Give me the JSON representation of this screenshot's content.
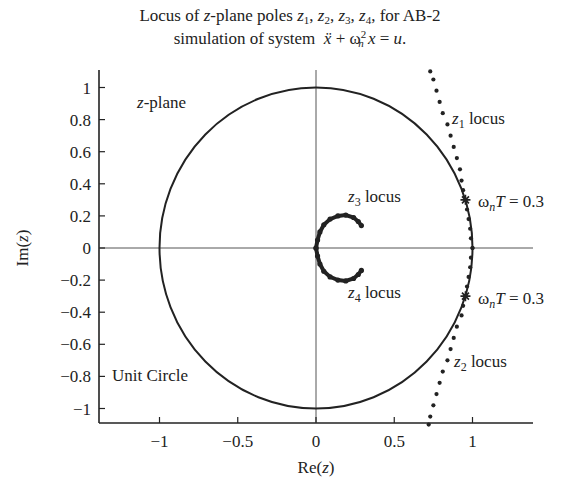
{
  "chart_data": {
    "type": "scatter",
    "title_line1": "Locus of z-plane poles z1, z2, z3, z4, for AB-2",
    "title_line2": "simulation of system ẍ + ωn² x = u.",
    "xlabel": "Re(z)",
    "ylabel": "Im(z)",
    "xlim": [
      -1.4,
      1.4
    ],
    "ylim": [
      -1.1,
      1.1
    ],
    "xticks": [
      "−1",
      "−0.5",
      "0",
      "0.5",
      "1"
    ],
    "yticks": [
      "1",
      "0.8",
      "0.6",
      "0.4",
      "0.2",
      "0",
      "−0.2",
      "−0.4",
      "−0.6",
      "−0.8",
      "−1"
    ],
    "grid": false,
    "legend": null,
    "annotations": {
      "zplane": "z-plane",
      "unit_circle": "Unit Circle",
      "z1": "z1 locus",
      "z2": "z2 locus",
      "z3": "z3 locus",
      "z4": "z4 locus",
      "wnT_upper": "ωnT = 0.3",
      "wnT_lower": "ωnT = 0.3"
    },
    "series": [
      {
        "name": "Unit circle",
        "kind": "line",
        "center": [
          0,
          0
        ],
        "radius": 1
      },
      {
        "name": "z1 locus",
        "kind": "dots",
        "points": [
          [
            0.73,
            1.1
          ],
          [
            0.75,
            1.05
          ],
          [
            0.77,
            0.98
          ],
          [
            0.79,
            0.91
          ],
          [
            0.81,
            0.84
          ],
          [
            0.84,
            0.77
          ],
          [
            0.86,
            0.7
          ],
          [
            0.88,
            0.63
          ],
          [
            0.9,
            0.56
          ],
          [
            0.92,
            0.49
          ],
          [
            0.93,
            0.42
          ],
          [
            0.94,
            0.36
          ],
          [
            0.955,
            0.3
          ],
          [
            0.965,
            0.24
          ],
          [
            0.975,
            0.18
          ],
          [
            0.985,
            0.12
          ],
          [
            0.99,
            0.06
          ],
          [
            1.0,
            0.0
          ]
        ]
      },
      {
        "name": "z2 locus",
        "kind": "dots",
        "points": [
          [
            1.0,
            0.0
          ],
          [
            0.99,
            -0.06
          ],
          [
            0.985,
            -0.12
          ],
          [
            0.975,
            -0.18
          ],
          [
            0.965,
            -0.24
          ],
          [
            0.955,
            -0.3
          ],
          [
            0.94,
            -0.36
          ],
          [
            0.93,
            -0.42
          ],
          [
            0.9,
            -0.49
          ],
          [
            0.88,
            -0.56
          ],
          [
            0.86,
            -0.63
          ],
          [
            0.84,
            -0.7
          ],
          [
            0.81,
            -0.77
          ],
          [
            0.79,
            -0.84
          ],
          [
            0.77,
            -0.91
          ],
          [
            0.75,
            -0.98
          ],
          [
            0.73,
            -1.05
          ],
          [
            0.72,
            -1.1
          ]
        ]
      },
      {
        "name": "z3 locus",
        "kind": "dots",
        "points": [
          [
            0.0,
            0.0
          ],
          [
            0.01,
            0.05
          ],
          [
            0.025,
            0.1
          ],
          [
            0.05,
            0.145
          ],
          [
            0.09,
            0.18
          ],
          [
            0.14,
            0.2
          ],
          [
            0.19,
            0.205
          ],
          [
            0.24,
            0.19
          ],
          [
            0.27,
            0.165
          ],
          [
            0.29,
            0.14
          ]
        ]
      },
      {
        "name": "z4 locus",
        "kind": "dots",
        "points": [
          [
            0.0,
            0.0
          ],
          [
            0.01,
            -0.05
          ],
          [
            0.025,
            -0.1
          ],
          [
            0.05,
            -0.145
          ],
          [
            0.09,
            -0.18
          ],
          [
            0.14,
            -0.2
          ],
          [
            0.19,
            -0.205
          ],
          [
            0.24,
            -0.19
          ],
          [
            0.27,
            -0.165
          ],
          [
            0.29,
            -0.14
          ]
        ]
      }
    ],
    "markers": [
      {
        "label": "ωnT = 0.3",
        "point": [
          0.955,
          0.3
        ],
        "symbol": "star"
      },
      {
        "label": "ωnT = 0.3",
        "point": [
          0.955,
          -0.3
        ],
        "symbol": "star"
      }
    ]
  }
}
